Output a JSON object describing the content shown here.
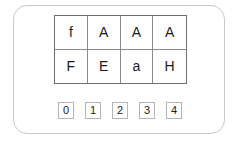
{
  "card": {
    "name": "character-grid-card",
    "border_color": "#c9c9c9",
    "background_color": "#ffffff"
  },
  "letter_grid": {
    "name": "letter-grid",
    "rows": 2,
    "columns": 4,
    "border_color": "#6e6e6e",
    "divider_color": "#8a8a8a",
    "text_color": "#1b1b1b",
    "cells": [
      [
        {
          "label": "f"
        },
        {
          "label": "A"
        },
        {
          "label": "A"
        },
        {
          "label": "A"
        }
      ],
      [
        {
          "label": "F"
        },
        {
          "label": "E"
        },
        {
          "label": "a"
        },
        {
          "label": "H"
        }
      ]
    ]
  },
  "digit_row": {
    "name": "digit-row",
    "border_color": "#b4b4b4",
    "text_color": "#1b1b1b",
    "digits": [
      {
        "label": "0"
      },
      {
        "label": "1"
      },
      {
        "label": "2"
      },
      {
        "label": "3"
      },
      {
        "label": "4"
      }
    ]
  }
}
